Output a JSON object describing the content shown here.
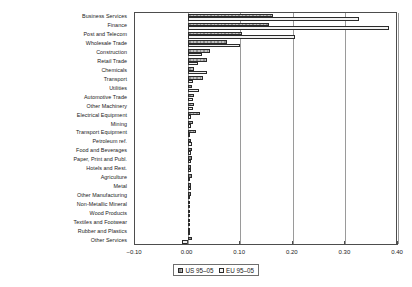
{
  "chart_data": {
    "type": "bar",
    "orientation": "horizontal",
    "grouped": true,
    "title": "",
    "subtitle": "",
    "xlabel": "",
    "ylabel": "",
    "xlim": [
      -0.1,
      0.4
    ],
    "xticks": [
      -0.1,
      0.0,
      0.1,
      0.2,
      0.3,
      0.4
    ],
    "xticklabels": [
      "−0.10",
      "0.00",
      "0.10",
      "0.20",
      "0.30",
      "0.40"
    ],
    "grid": true,
    "grid_axis": "x",
    "legend_position": "bottom-center",
    "legend": [
      "US 95–05",
      "EU 95–05"
    ],
    "categories": [
      "Business Services",
      "Finance",
      "Post and Telecom",
      "Wholesale Trade",
      "Construction",
      "Retail Trade",
      "Chemicals",
      "Transport",
      "Utilities",
      "Automotive Trade",
      "Other Machinery",
      "Electrical Equipment",
      "Mining",
      "Transport Equipment",
      "Petroleum ref.",
      "Food and Beverages",
      "Paper, Print and Publ.",
      "Hotels and Rest.",
      "Agriculture",
      "Metal",
      "Other Manufacturing",
      "Non-Metallic Mineral",
      "Wood Products",
      "Textiles and Footwear",
      "Rubber and Plastics",
      "Other Services"
    ],
    "series": [
      {
        "name": "US 95–05",
        "color": "#a8a8a8",
        "values": [
          0.163,
          0.155,
          0.104,
          0.074,
          0.043,
          0.037,
          0.012,
          0.029,
          0.008,
          0.013,
          0.012,
          0.024,
          0.011,
          0.016,
          0.006,
          0.008,
          0.008,
          0.006,
          0.008,
          0.006,
          0.007,
          0.005,
          0.004,
          0.004,
          0.004,
          0.008
        ]
      },
      {
        "name": "EU 95–05",
        "color": "#f2f2f2",
        "values": [
          0.325,
          0.382,
          0.205,
          0.1,
          0.028,
          0.02,
          0.036,
          0.011,
          0.022,
          0.01,
          0.011,
          0.006,
          0.007,
          0.005,
          0.009,
          0.006,
          0.007,
          0.007,
          0.005,
          0.007,
          0.005,
          0.005,
          0.004,
          0.003,
          0.004,
          -0.01
        ]
      }
    ]
  }
}
